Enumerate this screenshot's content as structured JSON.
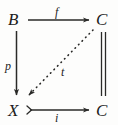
{
  "diagram": {
    "type": "commutative-diagram",
    "background_color": "#fdfdfc",
    "ink_color": "#1c1c1c",
    "nodes": [
      {
        "id": "B",
        "label": "B",
        "position": "top-left",
        "x": 8,
        "y": 11
      },
      {
        "id": "C1",
        "label": "C",
        "position": "top-right",
        "x": 96,
        "y": 11
      },
      {
        "id": "X",
        "label": "X",
        "position": "bottom-left",
        "x": 8,
        "y": 102
      },
      {
        "id": "C2",
        "label": "C",
        "position": "bottom-right",
        "x": 96,
        "y": 102
      }
    ],
    "edges": [
      {
        "id": "f",
        "label": "f",
        "from": "B",
        "to": "C1",
        "style": "solid",
        "arrowhead": "standard",
        "direction": "right",
        "placement": "top"
      },
      {
        "id": "p",
        "label": "p",
        "from": "B",
        "to": "X",
        "style": "solid",
        "arrowhead": "standard",
        "direction": "down",
        "placement": "left"
      },
      {
        "id": "i",
        "label": "i",
        "from": "X",
        "to": "C2",
        "style": "solid",
        "arrowhead": "standard",
        "arrowtail": "mono-hook",
        "direction": "right",
        "placement": "bottom"
      },
      {
        "id": "t",
        "label": "t",
        "from": "C1",
        "to": "X",
        "style": "dotted",
        "arrowhead": "standard",
        "direction": "diagonal-down-left",
        "placement": "interior"
      },
      {
        "id": "identity",
        "label": "",
        "from": "C1",
        "to": "C2",
        "style": "double-line",
        "arrowhead": "none",
        "direction": "vertical",
        "placement": "right"
      }
    ]
  }
}
